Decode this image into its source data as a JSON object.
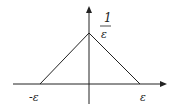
{
  "diagram": {
    "type": "triangle-function-plot",
    "labels": {
      "peak_numerator": "1",
      "peak_denominator": "ε",
      "left_x": "-ε",
      "right_x": "ε"
    },
    "colors": {
      "line": "#222222",
      "background": "#ffffff"
    }
  }
}
